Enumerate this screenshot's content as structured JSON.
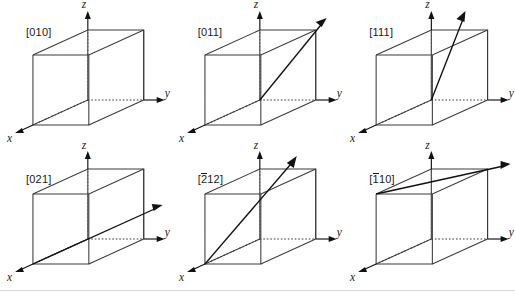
{
  "figure": {
    "background_color": "#ffffff",
    "edge_color": "#3a3a3a",
    "axis_color": "#111111",
    "vector_color": "#111111",
    "label_color": "#1a1a1a",
    "rule_color": "#d4d9de"
  },
  "axes": {
    "x_label": "x",
    "y_label": "y",
    "z_label": "z"
  },
  "cells": [
    {
      "id": "cell-010",
      "label": "[010]",
      "label_prefix": "[",
      "label_suffix": "]",
      "overbar_digit": "",
      "digits": "010",
      "indices": [
        0,
        1,
        0
      ],
      "has_vector": false,
      "vector_description": "direction lies along the y axis; no separate arrow drawn inside the cube"
    },
    {
      "id": "cell-011",
      "label": "[011]",
      "label_prefix": "[",
      "label_suffix": "]",
      "overbar_digit": "",
      "digits": "011",
      "indices": [
        0,
        1,
        1
      ],
      "has_vector": true,
      "vector_description": "from origin to the far top-right corner of the cube, arrow extends beyond"
    },
    {
      "id": "cell-111",
      "label": "[111]",
      "label_prefix": "[",
      "label_suffix": "]",
      "overbar_digit": "",
      "digits": "111",
      "indices": [
        1,
        1,
        1
      ],
      "has_vector": true,
      "vector_description": "from origin upward through the top face, arrow exits above the cube"
    },
    {
      "id": "cell-021",
      "label": "[021]",
      "label_prefix": "[",
      "label_suffix": "]",
      "overbar_digit": "",
      "digits": "021",
      "indices": [
        0,
        2,
        1
      ],
      "has_vector": true,
      "vector_description": "from the front-bottom-left rising to the right, arrow extends past the right face"
    },
    {
      "id": "cell-2bar12",
      "label": "[2̒2]",
      "label_prefix": "[",
      "label_suffix": "12]",
      "overbar_digit": "2",
      "digits": "212",
      "indices": [
        -2,
        1,
        2
      ],
      "has_vector": true,
      "vector_description": "from the front-bottom-left corner diagonally up and to the right, arrow exits the top face"
    },
    {
      "id": "cell-1bar10",
      "label": "[110]",
      "label_prefix": "[",
      "label_suffix": "10]",
      "overbar_digit": "1",
      "digits": "110",
      "indices": [
        -1,
        1,
        0
      ],
      "has_vector": true,
      "vector_description": "from the front-top-left corner along the top face to the right, arrow extends past the cube"
    }
  ]
}
